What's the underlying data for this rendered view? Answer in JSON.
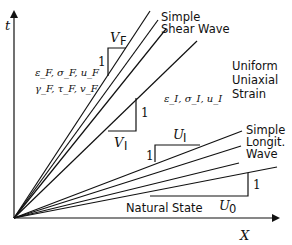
{
  "axes": {
    "y_label": "t",
    "x_label": "X"
  },
  "regions": {
    "far_field": {
      "line1": "ε_F, σ_F, u_F",
      "line2": "γ_F, τ_F, v_F"
    },
    "intermediate": "ε_I, σ_I, u_I",
    "uniform": [
      "Uniform",
      "Uniaxial",
      "Strain"
    ],
    "natural": "Natural State"
  },
  "waves": {
    "shear": [
      "Simple",
      "Shear Wave"
    ],
    "longitudinal": [
      "Simple",
      "Longit.",
      "Wave"
    ]
  },
  "slope_triangles": [
    {
      "name": "V_F",
      "base": "V",
      "sub": "F",
      "rise": "1"
    },
    {
      "name": "V_I",
      "base": "V",
      "sub": "I",
      "rise": "1"
    },
    {
      "name": "U_I",
      "base": "U",
      "sub": "I",
      "rise": "1"
    },
    {
      "name": "U_0",
      "base": "U",
      "sub": "0",
      "rise": "1"
    }
  ],
  "lines": {
    "origin": [
      14,
      218
    ],
    "shear_fan": [
      [
        150,
        11
      ],
      [
        158,
        20
      ],
      [
        166,
        29
      ],
      [
        197,
        41
      ]
    ],
    "longit_fan": [
      [
        242,
        131
      ],
      [
        241,
        146
      ],
      [
        239,
        163
      ],
      [
        277,
        167
      ]
    ]
  }
}
